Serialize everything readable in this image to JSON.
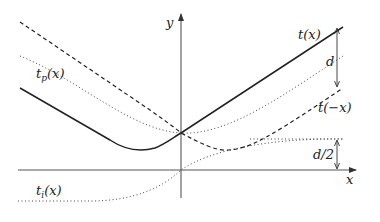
{
  "diagram": {
    "axes": {
      "x_label": "x",
      "y_label": "y"
    },
    "curves": [
      {
        "id": "t",
        "label": "t(x)",
        "style": "solid"
      },
      {
        "id": "t_neg",
        "label": "t(−x)",
        "style": "dashed"
      },
      {
        "id": "t_p",
        "label": "t",
        "label_sub": "p",
        "label_suffix": "(x)",
        "style": "dotted"
      },
      {
        "id": "t_i",
        "label": "t",
        "label_sub": "i",
        "label_suffix": "(x)",
        "style": "dotted"
      }
    ],
    "annotations": {
      "d": "d",
      "d_half": "d/2"
    }
  }
}
